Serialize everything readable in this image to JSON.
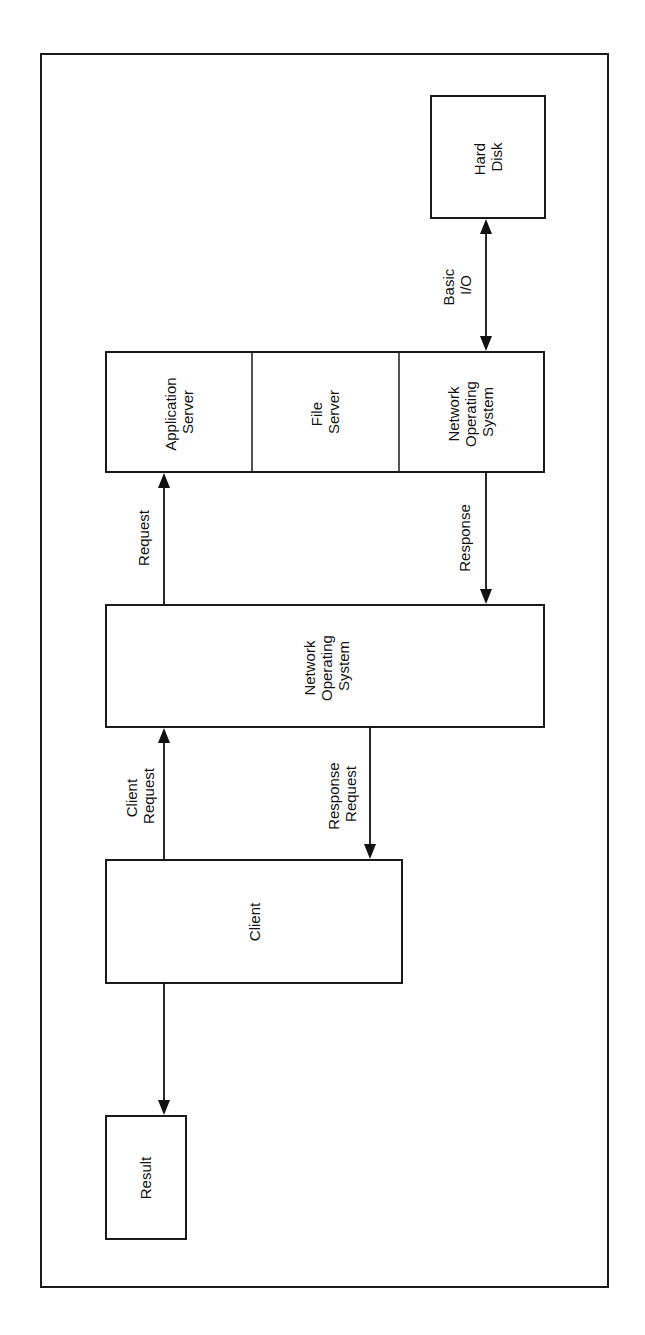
{
  "diagram": {
    "orientation": "rotated -90 degrees (reads bottom-to-top)",
    "colors": {
      "line": "#111111",
      "background": "#ffffff"
    },
    "nodes": {
      "hard_disk": {
        "lines": [
          "Hard",
          "Disk"
        ]
      },
      "application_server": {
        "lines": [
          "Application",
          "Server"
        ]
      },
      "file_server": {
        "lines": [
          "File",
          "Server"
        ]
      },
      "server_nos": {
        "lines": [
          "Network",
          "Operating",
          "System"
        ]
      },
      "middle_nos": {
        "lines": [
          "Network",
          "Operating",
          "System"
        ]
      },
      "client": {
        "lines": [
          "Client"
        ]
      },
      "result": {
        "lines": [
          "Result"
        ]
      }
    },
    "edges": {
      "basic_io": {
        "lines": [
          "Basic",
          "I/O"
        ],
        "from": "Network Operating System (server)",
        "to": "Hard Disk",
        "direction": "bidirectional"
      },
      "request": {
        "lines": [
          "Request"
        ],
        "from": "Network Operating System",
        "to": "Application Server",
        "direction": "forward"
      },
      "response": {
        "lines": [
          "Response"
        ],
        "from": "Network Operating System (server)",
        "to": "Network Operating System",
        "direction": "forward"
      },
      "client_request": {
        "lines": [
          "Client",
          "Request"
        ],
        "from": "Client",
        "to": "Network Operating System",
        "direction": "forward"
      },
      "response_request": {
        "lines": [
          "Response",
          "Request"
        ],
        "from": "Network Operating System",
        "to": "Client",
        "direction": "forward"
      },
      "client_result": {
        "lines": [],
        "from": "Client",
        "to": "Result",
        "direction": "forward"
      }
    }
  }
}
